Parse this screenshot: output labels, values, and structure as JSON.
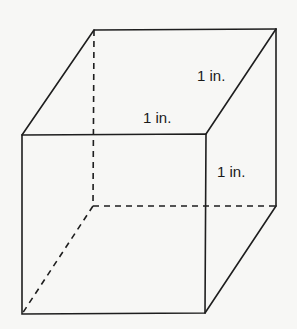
{
  "diagram": {
    "shape": "cube",
    "labels": {
      "top_front_edge": "1 in.",
      "top_right_edge": "1 in.",
      "right_vertical_edge": "1 in."
    },
    "vertices": {
      "front_top_left": [
        22,
        135
      ],
      "front_top_right": [
        206,
        134
      ],
      "front_bottom_left": [
        22,
        314
      ],
      "front_bottom_right": [
        205,
        313
      ],
      "back_top_left": [
        94,
        30
      ],
      "back_top_right": [
        276,
        29
      ],
      "back_bottom_left": [
        93,
        206
      ],
      "back_bottom_right": [
        276,
        206
      ]
    },
    "colors": {
      "line": "#1e1e1e",
      "background": "#f7f7f5"
    }
  }
}
